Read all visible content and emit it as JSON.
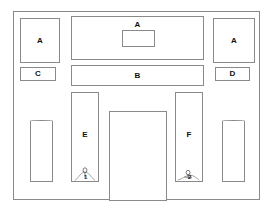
{
  "diagram": {
    "frame": {
      "name": "outer-frame"
    },
    "stroke_color": "#8a8a8a",
    "background_color": "#ffffff",
    "label_color": "#111111",
    "zones": [
      {
        "id": "left-upper",
        "label": "A",
        "x": 19,
        "y": 17,
        "w": 40,
        "h": 45
      },
      {
        "id": "center-upper",
        "label": "A",
        "x": 70,
        "y": 15,
        "w": 133,
        "h": 44
      },
      {
        "id": "right-upper",
        "label": "A",
        "x": 212,
        "y": 17,
        "w": 42,
        "h": 45
      },
      {
        "id": "center-band",
        "label": "B",
        "x": 70,
        "y": 64,
        "w": 133,
        "h": 21
      },
      {
        "id": "left-small",
        "label": "C",
        "x": 19,
        "y": 66,
        "w": 36,
        "h": 14
      },
      {
        "id": "right-small",
        "label": "D",
        "x": 214,
        "y": 66,
        "w": 35,
        "h": 14
      },
      {
        "id": "left-tall",
        "label": "E",
        "x": 70,
        "y": 91,
        "w": 28,
        "h": 90
      },
      {
        "id": "right-tall",
        "label": "F",
        "x": 174,
        "y": 91,
        "w": 28,
        "h": 90
      }
    ],
    "inner_box": {
      "name": "center-upper-inset",
      "x": 120,
      "y": 28,
      "w": 33,
      "h": 17
    },
    "arches": [
      {
        "id": "left-arch",
        "x": 29,
        "y": 119,
        "w": 23,
        "h": 62
      },
      {
        "id": "right-arch",
        "x": 221,
        "y": 119,
        "w": 23,
        "h": 62
      }
    ],
    "doorway": {
      "name": "central-doorway",
      "x": 108,
      "y": 110,
      "w": 58,
      "h": 90
    },
    "figures": [
      {
        "id": "figure-one",
        "number": "1",
        "in_zone": "left-tall"
      },
      {
        "id": "figure-two",
        "number": "2",
        "in_zone": "right-tall"
      }
    ]
  }
}
